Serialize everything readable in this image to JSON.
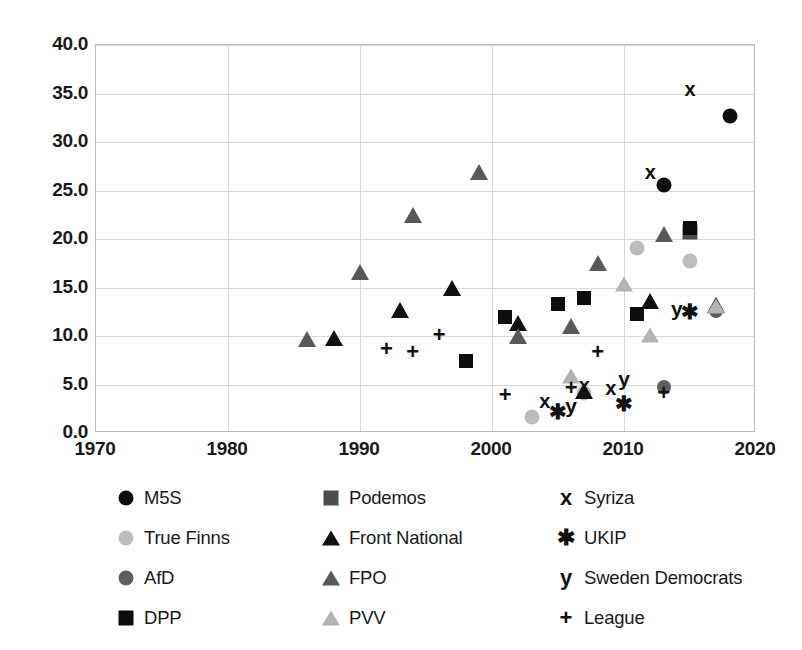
{
  "chart_data": {
    "type": "scatter",
    "title": "",
    "xlabel": "",
    "ylabel": "",
    "xlim": [
      1970,
      2020
    ],
    "ylim": [
      0.0,
      40.0
    ],
    "xticks": [
      "1970",
      "1980",
      "1990",
      "2000",
      "2010",
      "2020"
    ],
    "yticks": [
      "0.0",
      "5.0",
      "10.0",
      "15.0",
      "20.0",
      "25.0",
      "30.0",
      "35.0",
      "40.0"
    ],
    "xtick_values": [
      1970,
      1980,
      1990,
      2000,
      2010,
      2020
    ],
    "ytick_values": [
      0,
      5,
      10,
      15,
      20,
      25,
      30,
      35,
      40
    ],
    "grid": true,
    "legend_position": "bottom",
    "series": [
      {
        "name": "M5S",
        "marker": "circle",
        "color": "#0d0d0d",
        "size": 15,
        "points": [
          {
            "x": 2013,
            "y": 25.6
          },
          {
            "x": 2018,
            "y": 32.7
          }
        ]
      },
      {
        "name": "Podemos",
        "marker": "square",
        "color": "#4d4d4d",
        "size": 15,
        "points": [
          {
            "x": 2015,
            "y": 20.7
          }
        ]
      },
      {
        "name": "Syriza",
        "marker": "x",
        "color": "#111111",
        "size": 20,
        "points": [
          {
            "x": 2004,
            "y": 3.3
          },
          {
            "x": 2007,
            "y": 5.0
          },
          {
            "x": 2009,
            "y": 4.6
          },
          {
            "x": 2012,
            "y": 26.9
          },
          {
            "x": 2015,
            "y": 35.5
          }
        ]
      },
      {
        "name": "True Finns",
        "marker": "circle",
        "color": "#bdbdbd",
        "size": 15,
        "points": [
          {
            "x": 2003,
            "y": 1.6
          },
          {
            "x": 2007,
            "y": 4.1
          },
          {
            "x": 2011,
            "y": 19.1
          },
          {
            "x": 2015,
            "y": 17.7
          }
        ]
      },
      {
        "name": "Front National",
        "marker": "triangle",
        "color": "#111111",
        "size": 16,
        "points": [
          {
            "x": 1988,
            "y": 9.8
          },
          {
            "x": 1993,
            "y": 12.7
          },
          {
            "x": 1997,
            "y": 15.0
          },
          {
            "x": 2002,
            "y": 11.3
          },
          {
            "x": 2007,
            "y": 4.3
          },
          {
            "x": 2012,
            "y": 13.6
          },
          {
            "x": 2017,
            "y": 13.2
          }
        ]
      },
      {
        "name": "UKIP",
        "marker": "asterisk",
        "color": "#111111",
        "size": 21,
        "points": [
          {
            "x": 2005,
            "y": 2.3
          },
          {
            "x": 2010,
            "y": 3.1
          },
          {
            "x": 2015,
            "y": 12.6
          }
        ]
      },
      {
        "name": "AfD",
        "marker": "circle",
        "color": "#5e5e5e",
        "size": 14,
        "points": [
          {
            "x": 2013,
            "y": 4.7
          },
          {
            "x": 2017,
            "y": 12.6
          }
        ]
      },
      {
        "name": "FPO",
        "marker": "triangle",
        "color": "#595959",
        "size": 16,
        "points": [
          {
            "x": 1986,
            "y": 9.7
          },
          {
            "x": 1990,
            "y": 16.6
          },
          {
            "x": 1994,
            "y": 22.5
          },
          {
            "x": 1999,
            "y": 26.9
          },
          {
            "x": 2002,
            "y": 10.0
          },
          {
            "x": 2006,
            "y": 11.0
          },
          {
            "x": 2008,
            "y": 17.5
          },
          {
            "x": 2013,
            "y": 20.5
          }
        ]
      },
      {
        "name": "Sweden Democrats",
        "marker": "y",
        "color": "#111111",
        "size": 21,
        "points": [
          {
            "x": 2006,
            "y": 2.9
          },
          {
            "x": 2010,
            "y": 5.7
          },
          {
            "x": 2014,
            "y": 12.9
          }
        ]
      },
      {
        "name": "DPP",
        "marker": "square",
        "color": "#0d0d0d",
        "size": 14,
        "points": [
          {
            "x": 1998,
            "y": 7.4
          },
          {
            "x": 2001,
            "y": 12.0
          },
          {
            "x": 2005,
            "y": 13.3
          },
          {
            "x": 2007,
            "y": 13.9
          },
          {
            "x": 2011,
            "y": 12.3
          },
          {
            "x": 2015,
            "y": 21.1
          }
        ]
      },
      {
        "name": "PVV",
        "marker": "triangle",
        "color": "#b3b3b3",
        "size": 15,
        "points": [
          {
            "x": 2006,
            "y": 5.9
          },
          {
            "x": 2010,
            "y": 15.4
          },
          {
            "x": 2012,
            "y": 10.1
          },
          {
            "x": 2017,
            "y": 13.1
          }
        ]
      },
      {
        "name": "League",
        "marker": "plus",
        "color": "#111111",
        "size": 22,
        "points": [
          {
            "x": 1992,
            "y": 8.7
          },
          {
            "x": 1994,
            "y": 8.4
          },
          {
            "x": 1996,
            "y": 10.1
          },
          {
            "x": 2001,
            "y": 3.9
          },
          {
            "x": 2006,
            "y": 4.6
          },
          {
            "x": 2008,
            "y": 8.3
          },
          {
            "x": 2013,
            "y": 4.1
          }
        ]
      }
    ]
  },
  "legend": {
    "items": [
      {
        "label": "M5S",
        "marker": "circle",
        "color": "#0d0d0d"
      },
      {
        "label": "Podemos",
        "marker": "square",
        "color": "#4d4d4d"
      },
      {
        "label": "Syriza",
        "marker": "x",
        "color": "#111111"
      },
      {
        "label": "True Finns",
        "marker": "circle",
        "color": "#bdbdbd"
      },
      {
        "label": "Front National",
        "marker": "triangle",
        "color": "#111111"
      },
      {
        "label": "UKIP",
        "marker": "asterisk",
        "color": "#111111"
      },
      {
        "label": "AfD",
        "marker": "circle",
        "color": "#5e5e5e"
      },
      {
        "label": "FPO",
        "marker": "triangle",
        "color": "#595959"
      },
      {
        "label": "Sweden Democrats",
        "marker": "y",
        "color": "#111111"
      },
      {
        "label": "DPP",
        "marker": "square",
        "color": "#0d0d0d"
      },
      {
        "label": "PVV",
        "marker": "triangle",
        "color": "#b3b3b3"
      },
      {
        "label": "League",
        "marker": "plus",
        "color": "#111111"
      }
    ]
  },
  "colors": {
    "grid": "#d9d9d9",
    "frame": "#b9b9b9",
    "text": "#1a1a1a",
    "background": "#ffffff"
  }
}
